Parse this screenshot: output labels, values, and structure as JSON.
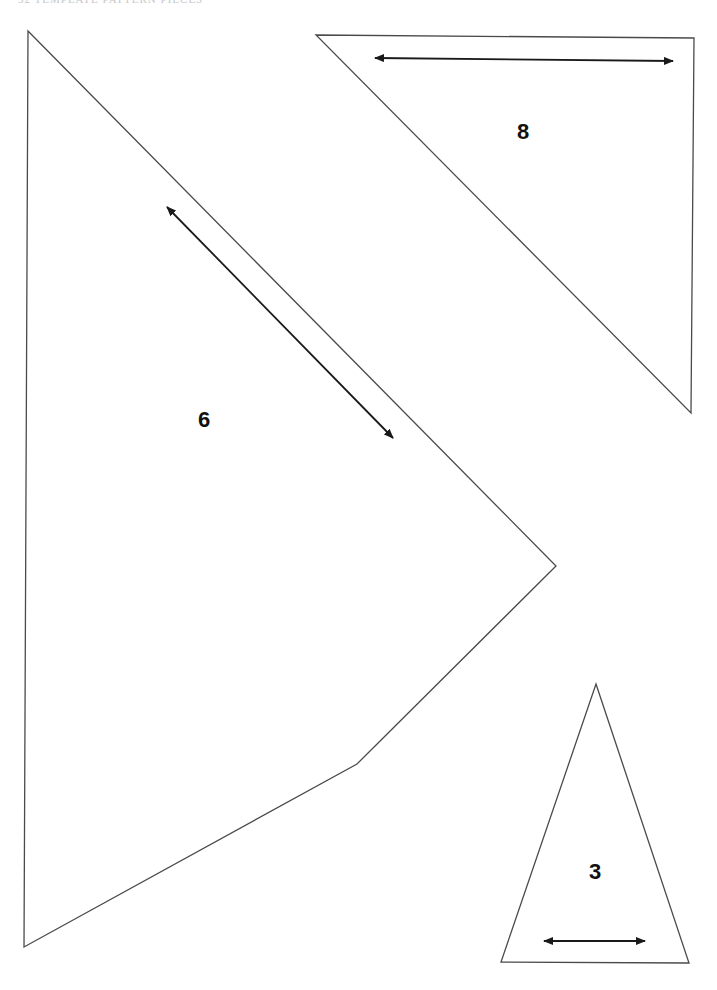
{
  "page": {
    "header_text": "32  TEMPLATE PATTERN PIECES",
    "background": "#ffffff",
    "line_color": "#4a4a4a",
    "arrow_color": "#1a1a1a"
  },
  "pieces": [
    {
      "id": "piece-6",
      "label": "6",
      "shape": "pentagon",
      "points": [
        [
          28,
          31
        ],
        [
          556,
          566
        ],
        [
          357,
          764
        ],
        [
          24,
          947
        ]
      ],
      "label_pos": [
        204,
        420
      ],
      "grain_arrow": {
        "from": [
          167,
          207
        ],
        "to": [
          393,
          438
        ]
      }
    },
    {
      "id": "piece-8",
      "label": "8",
      "shape": "right-triangle",
      "points": [
        [
          316,
          35
        ],
        [
          694,
          38
        ],
        [
          691,
          413
        ]
      ],
      "label_pos": [
        523,
        132
      ],
      "grain_arrow": {
        "from": [
          375,
          58
        ],
        "to": [
          673,
          61
        ]
      }
    },
    {
      "id": "piece-3",
      "label": "3",
      "shape": "isosceles-triangle",
      "points": [
        [
          596,
          684
        ],
        [
          689,
          963
        ],
        [
          501,
          962
        ]
      ],
      "label_pos": [
        595,
        872
      ],
      "grain_arrow": {
        "from": [
          544,
          941
        ],
        "to": [
          645,
          941
        ]
      }
    }
  ]
}
